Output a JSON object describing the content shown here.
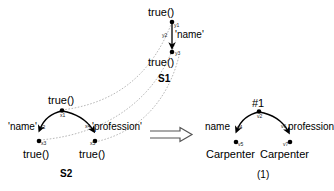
{
  "figure": {
    "caption_left": "S2",
    "caption_right": "(1)",
    "caption_top": "S1",
    "implication_symbol": "double-right-arrow"
  },
  "s1_tree": {
    "name": "S1",
    "nodes": [
      {
        "id": "y1",
        "label": "true()",
        "var": "y1"
      },
      {
        "id": "y2",
        "var": "y2"
      },
      {
        "id": "y3",
        "label": "true()",
        "var": "y3"
      }
    ],
    "edges": [
      {
        "from": "y1",
        "to": "y3",
        "label": "'name'",
        "mid_var": "y2"
      }
    ]
  },
  "s2_tree": {
    "name": "S2",
    "nodes": [
      {
        "id": "x1",
        "label": "true()",
        "var": "x1"
      },
      {
        "id": "x3",
        "label": "true()",
        "var": "x3"
      },
      {
        "id": "x5",
        "label": "true()",
        "var": "x5"
      }
    ],
    "edges": [
      {
        "from": "x1",
        "to": "x3",
        "label": "'name'",
        "mid_var": "x2"
      },
      {
        "from": "x1",
        "to": "x5",
        "label": "'profession'",
        "mid_var": "x4"
      }
    ]
  },
  "result_tree": {
    "name": "(1)",
    "nodes": [
      {
        "id": "v2",
        "label": "#1",
        "var": "v2"
      },
      {
        "id": "v5",
        "label": "Carpenter",
        "var": "v5"
      },
      {
        "id": "v7",
        "label": "Carpenter",
        "var": "v7"
      }
    ],
    "edges": [
      {
        "from": "v2",
        "to": "v5",
        "label": "name",
        "mid_var": "v4"
      },
      {
        "from": "v2",
        "to": "v7",
        "label": "profession",
        "mid_var": "v6"
      }
    ]
  },
  "labels": {
    "s1_root_text": "true()",
    "s1_leaf_text": "true()",
    "s1_edge_name": "'name'",
    "s1_var_y1": "y1",
    "s1_var_y2": "y2",
    "s1_var_y3": "y3",
    "s1_caption": "S1",
    "s2_root_text": "true()",
    "s2_left_leaf_text": "true()",
    "s2_right_leaf_text": "true()",
    "s2_edge_name": "'name'",
    "s2_edge_profession": "'profession'",
    "s2_var_x1": "x1",
    "s2_var_x2": "x2",
    "s2_var_x3": "x3",
    "s2_var_x4": "x4",
    "s2_var_x5": "x5",
    "s2_caption": "S2",
    "res_root_text": "#1",
    "res_left_leaf_text": "Carpenter",
    "res_right_leaf_text": "Carpenter",
    "res_edge_name": "name",
    "res_edge_profession": "profession",
    "res_var_v2": "v2",
    "res_var_v4": "v4",
    "res_var_v5": "v5",
    "res_var_v6": "v6",
    "res_var_v7": "v7",
    "res_caption": "(1)"
  },
  "colors": {
    "ink": "#000000",
    "dotted": "#9a9a9a",
    "arrow_outline": "#555555",
    "background": "#ffffff"
  }
}
